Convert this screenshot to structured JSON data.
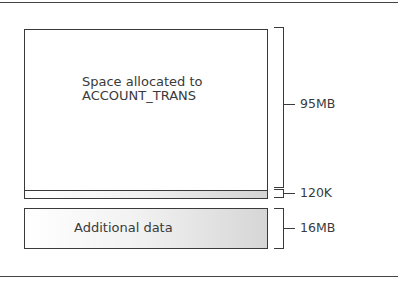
{
  "diagram": {
    "type": "storage-allocation-diagram",
    "blocks": [
      {
        "id": "main",
        "label": "Space allocated to\nACCOUNT_TRANS",
        "label_line1": "Space allocated to",
        "label_line2": "ACCOUNT_TRANS",
        "size_label": "95MB"
      },
      {
        "id": "strip",
        "label": "",
        "size_label": "120K"
      },
      {
        "id": "additional",
        "label": "Additional data",
        "size_label": "16MB"
      }
    ]
  },
  "labels": {
    "main_line1": "Space allocated to",
    "main_line2": "ACCOUNT_TRANS",
    "additional": "Additional data",
    "size_main": "95MB",
    "size_strip": "120K",
    "size_additional": "16MB"
  },
  "colors": {
    "border": "#3a3a3a",
    "gradient_start": "#ffffff",
    "gradient_end": "#d6d6d6",
    "text": "#3a3a3a"
  }
}
